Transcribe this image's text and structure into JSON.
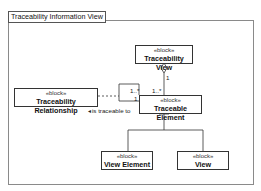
{
  "diagram": {
    "frame_title": "Traceability Information View",
    "blocks": [
      {
        "id": "traceability-view",
        "stereotype": "«block»",
        "name": "Traceability View"
      },
      {
        "id": "traceable-element",
        "stereotype": "«block»",
        "name": "Traceable Element"
      },
      {
        "id": "traceability-relationship",
        "stereotype": "«block»",
        "name": "Traceability Relationship"
      },
      {
        "id": "view-element",
        "stereotype": "«block»",
        "name": "View Element"
      },
      {
        "id": "view",
        "stereotype": "«block»",
        "name": "View"
      }
    ],
    "relationships": [
      {
        "type": "aggregation",
        "from": "Traceability View",
        "to": "Traceable Element",
        "source_multiplicity": "1",
        "target_multiplicity": "1..*"
      },
      {
        "type": "association",
        "from": "Traceable Element",
        "to": "Traceable Element",
        "label": "is traceable to",
        "multiplicities": [
          "1..*",
          "1"
        ]
      },
      {
        "type": "dependency",
        "from": "Traceability Relationship",
        "to": "is traceable to association"
      },
      {
        "type": "generalization",
        "from": "View Element",
        "to": "Traceable Element"
      },
      {
        "type": "generalization",
        "from": "View",
        "to": "Traceable Element"
      }
    ],
    "labels": {
      "agg_top_mult": "1",
      "agg_bottom_mult": "1..*",
      "assoc_mult_a": "1..*",
      "assoc_mult_b": "1",
      "assoc_name": "is traceable to",
      "assoc_arrow": "◄"
    }
  }
}
